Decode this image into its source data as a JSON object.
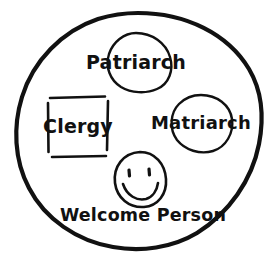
{
  "canvas": {
    "width": 276,
    "height": 269,
    "background_color": "#ffffff",
    "ink_color": "#111111",
    "style": "hand-drawn sketch"
  },
  "diagram": {
    "title": "",
    "outer_shape": {
      "label": "",
      "shape": "circle",
      "name": "community-boundary"
    },
    "nodes": [
      {
        "id": "patriarch",
        "label": "Patriarch",
        "shape": "circle",
        "position": "top",
        "cx": 136,
        "cy": 62,
        "r": 29
      },
      {
        "id": "clergy",
        "label": "Clergy",
        "shape": "square",
        "position": "left",
        "x": 47,
        "y": 96,
        "width": 61,
        "height": 62
      },
      {
        "id": "matriarch",
        "label": "Matriarch",
        "shape": "circle",
        "position": "right",
        "cx": 201,
        "cy": 123,
        "r": 29
      },
      {
        "id": "welcome-person",
        "label": "Welcome Person",
        "shape": "smiley-face",
        "position": "bottom",
        "cx": 140,
        "cy": 179,
        "rx": 25,
        "ry": 27
      }
    ]
  }
}
